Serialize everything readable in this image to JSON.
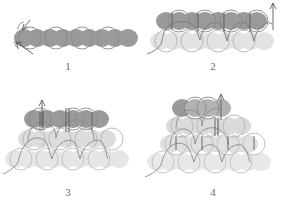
{
  "figure": {
    "background_color": "#ffffff"
  },
  "colors": {
    "bead_dark": "#8c8c8c",
    "bead_mid": "#a8a8a8",
    "bead_light": "#d4d4d4",
    "bead_pale": "#e2e2e2",
    "outline": "#8a8a8a",
    "thread": "#7a7a7a",
    "needle": "#5a5a5a",
    "label_text": "#6d6d6d"
  },
  "panels": [
    {
      "id": "panel-1",
      "label": "1",
      "caption": "1",
      "rows": 1,
      "bead_counts": [
        9
      ],
      "description": "Single horizontal ladder row of beads with thread entering from lower left and needle arrow pointing up-left",
      "needle_arrows": 1,
      "thread_tail": "lower-left"
    },
    {
      "id": "panel-2",
      "label": "2",
      "caption": "2",
      "rows": 2,
      "bead_counts": [
        8,
        9
      ],
      "description": "Second row of dark beads added above the first pale row; four needle strokes rise through the upper beads with an arrow at the right",
      "needle_arrows": 1,
      "thread_tail": "lower-left"
    },
    {
      "id": "panel-3",
      "label": "3",
      "caption": "3",
      "rows": 3,
      "bead_counts": [
        6,
        8,
        9
      ],
      "description": "Third row of dark beads decreasing toward a pyramid; needle arrow points up from the left of the top row",
      "needle_arrows": 1,
      "thread_tail": "lower-left"
    },
    {
      "id": "panel-4",
      "label": "4",
      "caption": "4",
      "rows": 4,
      "bead_counts": [
        4,
        6,
        8,
        9
      ],
      "description": "Fourth row completes the triangular pyramid; needle arrow points up at the top right bead",
      "needle_arrows": 1,
      "thread_tail": "lower-left"
    }
  ],
  "labels": {
    "panel_1": "1",
    "panel_2": "2",
    "panel_3": "3",
    "panel_4": "4"
  }
}
